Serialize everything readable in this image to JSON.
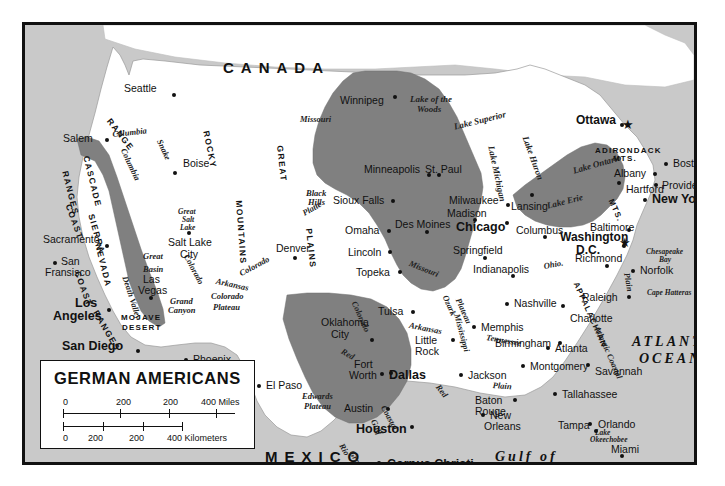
{
  "map": {
    "title": "GERMAN AMERICANS",
    "countries": [
      {
        "name": "CANADA",
        "x": 198,
        "y": 35
      },
      {
        "name": "MEXICO",
        "x": 240,
        "y": 424
      }
    ],
    "oceans": [
      {
        "name": "ATLANTIC",
        "x": 607,
        "y": 310
      },
      {
        "name": "OCEAN",
        "x": 614,
        "y": 327
      },
      {
        "name": "Gulf of",
        "x": 470,
        "y": 425
      },
      {
        "name": "Mexico",
        "x": 470,
        "y": 440
      }
    ],
    "cities": [
      {
        "name": "Seattle",
        "x": 99,
        "y": 58,
        "dx": 48,
        "dy": 10,
        "style": "city"
      },
      {
        "name": "Salem",
        "x": 38,
        "y": 108,
        "dx": 42,
        "dy": 5,
        "style": "city"
      },
      {
        "name": "Boise",
        "x": 158,
        "y": 133,
        "dx": -10,
        "dy": 13,
        "style": "city"
      },
      {
        "name": "Sacramento",
        "x": 18,
        "y": 209,
        "dx": 62,
        "dy": 10,
        "style": "city"
      },
      {
        "name": "San",
        "x": 36,
        "y": 231,
        "dx": -8,
        "dy": 5,
        "style": "city"
      },
      {
        "name": "Fransisco",
        "x": 20,
        "y": 242,
        "dx": 0,
        "dy": 0,
        "style": "city"
      },
      {
        "name": "Los",
        "x": 50,
        "y": 272,
        "dx": 32,
        "dy": 11,
        "style": "city-big"
      },
      {
        "name": "Angeles",
        "x": 28,
        "y": 285,
        "dx": 0,
        "dy": 0,
        "style": "city-big"
      },
      {
        "name": "San Diego",
        "x": 37,
        "y": 315,
        "dx": 74,
        "dy": 9,
        "style": "city-big"
      },
      {
        "name": "Las",
        "x": 118,
        "y": 249,
        "dx": 6,
        "dy": 22,
        "style": "city"
      },
      {
        "name": "Vegas",
        "x": 113,
        "y": 260,
        "dx": 0,
        "dy": 0,
        "style": "city"
      },
      {
        "name": "Salt Lake",
        "x": 143,
        "y": 212,
        "dx": 19,
        "dy": -6,
        "style": "city"
      },
      {
        "name": "City",
        "x": 155,
        "y": 224,
        "dx": 0,
        "dy": 0,
        "style": "city"
      },
      {
        "name": "Phoenix",
        "x": 168,
        "y": 329,
        "dx": -9,
        "dy": 4,
        "style": "city"
      },
      {
        "name": "Tuscon",
        "x": 181,
        "y": 346,
        "dx": -6,
        "dy": 5,
        "style": "city"
      },
      {
        "name": "Denver",
        "x": 251,
        "y": 218,
        "dx": 17,
        "dy": 13,
        "style": "city"
      },
      {
        "name": "El Paso",
        "x": 241,
        "y": 355,
        "dx": -9,
        "dy": 4,
        "style": "city"
      },
      {
        "name": "Winnipeg",
        "x": 315,
        "y": 70,
        "dx": 53,
        "dy": 0,
        "style": "city"
      },
      {
        "name": "Minneapolis",
        "x": 339,
        "y": 139,
        "dx": 63,
        "dy": 9,
        "style": "city"
      },
      {
        "name": "St. Paul",
        "x": 400,
        "y": 139,
        "dx": 12,
        "dy": 9,
        "style": "city"
      },
      {
        "name": "Sioux Falls",
        "x": 308,
        "y": 170,
        "dx": 58,
        "dy": 4,
        "style": "city"
      },
      {
        "name": "Milwaukee",
        "x": 424,
        "y": 170,
        "dx": 57,
        "dy": 8,
        "style": "city"
      },
      {
        "name": "Madison",
        "x": 422,
        "y": 183,
        "dx": 26,
        "dy": 10,
        "style": "city"
      },
      {
        "name": "Omaha",
        "x": 320,
        "y": 200,
        "dx": 42,
        "dy": 4,
        "style": "city"
      },
      {
        "name": "Des Moines",
        "x": 370,
        "y": 194,
        "dx": 30,
        "dy": 11,
        "style": "city"
      },
      {
        "name": "Chicago",
        "x": 431,
        "y": 196,
        "dx": 49,
        "dy": 0,
        "style": "city-big"
      },
      {
        "name": "Lincoln",
        "x": 323,
        "y": 222,
        "dx": 40,
        "dy": 3,
        "style": "city"
      },
      {
        "name": "Topeka",
        "x": 331,
        "y": 242,
        "dx": 42,
        "dy": 3,
        "style": "city"
      },
      {
        "name": "Springfield",
        "x": 428,
        "y": 220,
        "dx": 30,
        "dy": 11,
        "style": "city"
      },
      {
        "name": "Indianapolis",
        "x": 448,
        "y": 239,
        "dx": 38,
        "dy": 10,
        "style": "city"
      },
      {
        "name": "Lansing",
        "x": 486,
        "y": 176,
        "dx": 19,
        "dy": -8,
        "style": "city"
      },
      {
        "name": "Columbus",
        "x": 491,
        "y": 200,
        "dx": 27,
        "dy": 10,
        "style": "city"
      },
      {
        "name": "Baltimore",
        "x": 565,
        "y": 197,
        "dx": 37,
        "dy": 6,
        "style": "city"
      },
      {
        "name": "Washington",
        "x": 535,
        "y": 206,
        "dx": 62,
        "dy": 13,
        "style": "capital"
      },
      {
        "name": "D.C.",
        "x": 551,
        "y": 219,
        "dx": 0,
        "dy": 0,
        "style": "capital"
      },
      {
        "name": "Ottawa",
        "x": 551,
        "y": 89,
        "dx": 44,
        "dy": 9,
        "style": "capital"
      },
      {
        "name": "Albany",
        "x": 589,
        "y": 143,
        "dx": 39,
        "dy": 4,
        "style": "city"
      },
      {
        "name": "Hartford",
        "x": 601,
        "y": 159,
        "dx": -9,
        "dy": -3,
        "style": "city"
      },
      {
        "name": "Boston",
        "x": 648,
        "y": 133,
        "dx": -9,
        "dy": 4,
        "style": "city"
      },
      {
        "name": "Providence",
        "x": 637,
        "y": 155,
        "dx": -8,
        "dy": 3,
        "style": "city"
      },
      {
        "name": "New York",
        "x": 627,
        "y": 168,
        "dx": -9,
        "dy": 5,
        "style": "city-big"
      },
      {
        "name": "Richmond",
        "x": 550,
        "y": 228,
        "dx": 30,
        "dy": 11,
        "style": "city"
      },
      {
        "name": "Norfolk",
        "x": 615,
        "y": 240,
        "dx": -9,
        "dy": 4,
        "style": "city"
      },
      {
        "name": "Raleigh",
        "x": 557,
        "y": 267,
        "dx": 45,
        "dy": 3,
        "style": "city"
      },
      {
        "name": "Charlotte",
        "x": 545,
        "y": 288,
        "dx": -9,
        "dy": -9,
        "style": "city"
      },
      {
        "name": "Nashville",
        "x": 489,
        "y": 273,
        "dx": -9,
        "dy": 4,
        "style": "city"
      },
      {
        "name": "Memphis",
        "x": 456,
        "y": 297,
        "dx": -9,
        "dy": 3,
        "style": "city"
      },
      {
        "name": "Birmingham",
        "x": 470,
        "y": 313,
        "dx": 63,
        "dy": 3,
        "style": "city"
      },
      {
        "name": "Atlanta",
        "x": 530,
        "y": 318,
        "dx": -9,
        "dy": 3,
        "style": "city"
      },
      {
        "name": "Montgomery",
        "x": 505,
        "y": 336,
        "dx": -9,
        "dy": 3,
        "style": "city"
      },
      {
        "name": "Savannah",
        "x": 570,
        "y": 341,
        "dx": -9,
        "dy": -3,
        "style": "city"
      },
      {
        "name": "Tallahassee",
        "x": 537,
        "y": 364,
        "dx": -9,
        "dy": 3,
        "style": "city"
      },
      {
        "name": "Jackson",
        "x": 443,
        "y": 345,
        "dx": -9,
        "dy": 3,
        "style": "city"
      },
      {
        "name": "Baton",
        "x": 450,
        "y": 370,
        "dx": 38,
        "dy": 3,
        "style": "city"
      },
      {
        "name": "Rouge",
        "x": 450,
        "y": 381,
        "dx": 0,
        "dy": 0,
        "style": "city"
      },
      {
        "name": "New",
        "x": 465,
        "y": 385,
        "dx": -9,
        "dy": 3,
        "style": "city"
      },
      {
        "name": "Orleans",
        "x": 459,
        "y": 396,
        "dx": 0,
        "dy": 0,
        "style": "city"
      },
      {
        "name": "Tampa",
        "x": 533,
        "y": 395,
        "dx": 36,
        "dy": 9,
        "style": "city"
      },
      {
        "name": "Orlando",
        "x": 573,
        "y": 394,
        "dx": -10,
        "dy": 3,
        "style": "city"
      },
      {
        "name": "Miami",
        "x": 586,
        "y": 419,
        "dx": 9,
        "dy": 10,
        "style": "city"
      },
      {
        "name": "Tulsa",
        "x": 353,
        "y": 281,
        "dx": 33,
        "dy": 4,
        "style": "city"
      },
      {
        "name": "Oklahoma",
        "x": 296,
        "y": 292,
        "dx": 49,
        "dy": 21,
        "style": "city"
      },
      {
        "name": "City",
        "x": 306,
        "y": 304,
        "dx": 0,
        "dy": 0,
        "style": "city"
      },
      {
        "name": "Little",
        "x": 390,
        "y": 310,
        "dx": 36,
        "dy": 3,
        "style": "city"
      },
      {
        "name": "Rock",
        "x": 390,
        "y": 321,
        "dx": 0,
        "dy": 0,
        "style": "city"
      },
      {
        "name": "Fort",
        "x": 329,
        "y": 334,
        "dx": 35,
        "dy": 12,
        "style": "city"
      },
      {
        "name": "Worth",
        "x": 324,
        "y": 345,
        "dx": 0,
        "dy": 0,
        "style": "city"
      },
      {
        "name": "Dallas",
        "x": 364,
        "y": 344,
        "dx": -9,
        "dy": 3,
        "style": "city-big"
      },
      {
        "name": "Austin",
        "x": 319,
        "y": 378,
        "dx": 42,
        "dy": 4,
        "style": "city"
      },
      {
        "name": "Houston",
        "x": 331,
        "y": 398,
        "dx": 54,
        "dy": 2,
        "style": "city-big"
      },
      {
        "name": "Corpus Christi",
        "x": 362,
        "y": 433,
        "dx": -10,
        "dy": 3,
        "style": "city-big"
      }
    ],
    "water_labels": [
      {
        "name": "Lake of the",
        "x": 385,
        "y": 70,
        "style": "water"
      },
      {
        "name": "Woods",
        "x": 392,
        "y": 80,
        "style": "water"
      },
      {
        "name": "Lake Superior",
        "x": 428,
        "y": 98,
        "style": "water",
        "rot": -14
      },
      {
        "name": "Lake Michigan",
        "x": 470,
        "y": 120,
        "style": "water",
        "rot": 78
      },
      {
        "name": "Lake Huron",
        "x": 504,
        "y": 110,
        "style": "water",
        "rot": 70
      },
      {
        "name": "Lake Ontario",
        "x": 547,
        "y": 142,
        "style": "water",
        "rot": -16
      },
      {
        "name": "Lake Erie",
        "x": 521,
        "y": 177,
        "style": "water",
        "rot": -14
      },
      {
        "name": "Great",
        "x": 153,
        "y": 183,
        "style": "water-sm"
      },
      {
        "name": "Salt",
        "x": 157,
        "y": 191,
        "style": "water-sm"
      },
      {
        "name": "Lake",
        "x": 155,
        "y": 199,
        "style": "water-sm"
      },
      {
        "name": "Chesapeake",
        "x": 621,
        "y": 223,
        "style": "water-sm"
      },
      {
        "name": "Bay",
        "x": 634,
        "y": 231,
        "style": "water-sm"
      },
      {
        "name": "Cape Hatteras",
        "x": 622,
        "y": 264,
        "style": "water-sm"
      },
      {
        "name": "Lake",
        "x": 570,
        "y": 404,
        "style": "water-sm"
      },
      {
        "name": "Okeechobee",
        "x": 565,
        "y": 411,
        "style": "water-sm"
      },
      {
        "name": "Missouri",
        "x": 275,
        "y": 90,
        "style": "physio",
        "rot": 0
      },
      {
        "name": "Columbia",
        "x": 87,
        "y": 105,
        "style": "physio",
        "rot": -6
      },
      {
        "name": "Columbia",
        "x": 102,
        "y": 122,
        "style": "physio",
        "rot": 65
      },
      {
        "name": "Snake",
        "x": 138,
        "y": 113,
        "style": "physio",
        "rot": 65
      },
      {
        "name": "Platte",
        "x": 276,
        "y": 185,
        "style": "physio",
        "rot": -30
      },
      {
        "name": "Colorado",
        "x": 165,
        "y": 228,
        "style": "physio",
        "rot": 62
      },
      {
        "name": "Colorado",
        "x": 213,
        "y": 245,
        "style": "physio",
        "rot": -28
      },
      {
        "name": "Arkansas",
        "x": 192,
        "y": 252,
        "style": "physio",
        "rot": 12
      },
      {
        "name": "Missouri",
        "x": 386,
        "y": 234,
        "style": "physio",
        "rot": 22
      },
      {
        "name": "Arkansas",
        "x": 385,
        "y": 296,
        "style": "physio",
        "rot": 11
      },
      {
        "name": "Mississippi",
        "x": 436,
        "y": 288,
        "style": "physio",
        "rot": 75
      },
      {
        "name": "Ohio.",
        "x": 518,
        "y": 237,
        "style": "physio",
        "rot": -10
      },
      {
        "name": "Tennessee",
        "x": 462,
        "y": 308,
        "style": "physio",
        "rot": 10
      },
      {
        "name": "Red",
        "x": 319,
        "y": 322,
        "style": "physio",
        "rot": 30
      },
      {
        "name": "Red",
        "x": 416,
        "y": 358,
        "style": "physio",
        "rot": 52
      },
      {
        "name": "Rio",
        "x": 320,
        "y": 417,
        "style": "physio",
        "rot": 60
      },
      {
        "name": "Grande",
        "x": 330,
        "y": 424,
        "style": "physio",
        "rot": 60
      },
      {
        "name": "Colorado",
        "x": 333,
        "y": 275,
        "style": "physio",
        "rot": 66
      }
    ],
    "physio_labels": [
      {
        "name": "Black",
        "x": 281,
        "y": 164,
        "style": "physio"
      },
      {
        "name": "Hills",
        "x": 283,
        "y": 173,
        "style": "physio"
      },
      {
        "name": "Great",
        "x": 118,
        "y": 227,
        "style": "physio"
      },
      {
        "name": "Basin",
        "x": 118,
        "y": 240,
        "style": "physio"
      },
      {
        "name": "Death Valley",
        "x": 104,
        "y": 250,
        "style": "physio",
        "rot": 72
      },
      {
        "name": "Grand",
        "x": 145,
        "y": 272,
        "style": "physio"
      },
      {
        "name": "Canyon",
        "x": 143,
        "y": 281,
        "style": "physio"
      },
      {
        "name": "Colorado",
        "x": 186,
        "y": 267,
        "style": "physio"
      },
      {
        "name": "Plateau",
        "x": 188,
        "y": 278,
        "style": "physio"
      },
      {
        "name": "Ozark",
        "x": 424,
        "y": 269,
        "style": "physio",
        "rot": 66
      },
      {
        "name": "Plateau",
        "x": 437,
        "y": 272,
        "style": "physio",
        "rot": 66
      },
      {
        "name": "Edwards",
        "x": 277,
        "y": 367,
        "style": "physio"
      },
      {
        "name": "Plateau",
        "x": 279,
        "y": 377,
        "style": "physio"
      },
      {
        "name": "Gulf",
        "x": 352,
        "y": 393,
        "style": "physio",
        "rot": 64
      },
      {
        "name": "Coastal",
        "x": 362,
        "y": 379,
        "style": "physio",
        "rot": 62
      },
      {
        "name": "Plain",
        "x": 468,
        "y": 356,
        "style": "physio",
        "rot": 4
      },
      {
        "name": "Atlantic Coastal",
        "x": 576,
        "y": 300,
        "style": "physio",
        "rot": 66
      },
      {
        "name": "Plain",
        "x": 606,
        "y": 247,
        "style": "physio",
        "rot": 80
      },
      {
        "name": "MOJAVE",
        "x": 96,
        "y": 289,
        "style": "physio-caps"
      },
      {
        "name": "DESERT",
        "x": 97,
        "y": 299,
        "style": "physio-caps"
      },
      {
        "name": "ADIRONDACK",
        "x": 570,
        "y": 122,
        "style": "physio-caps"
      },
      {
        "name": "MTS.",
        "x": 588,
        "y": 130,
        "style": "physio-caps"
      },
      {
        "name": "APPALACHIAN",
        "x": 554,
        "y": 256,
        "style": "physio-caps",
        "rot": 66
      },
      {
        "name": "MTS.",
        "x": 589,
        "y": 173,
        "style": "physio-caps",
        "rot": 66
      }
    ],
    "range_labels": [
      {
        "name": "COAST",
        "x": 47,
        "y": 178,
        "rot": 70
      },
      {
        "name": "RANGES",
        "x": 44,
        "y": 145,
        "rot": 76
      },
      {
        "name": "CASCADE",
        "x": 65,
        "y": 130,
        "rot": 76
      },
      {
        "name": "RANGE",
        "x": 87,
        "y": 92,
        "rot": 52
      },
      {
        "name": "SIERRA",
        "x": 70,
        "y": 188,
        "rot": 74
      },
      {
        "name": "NEVADA",
        "x": 77,
        "y": 218,
        "rot": 76
      },
      {
        "name": "COAST",
        "x": 56,
        "y": 245,
        "rot": 70
      },
      {
        "name": "RANGES",
        "x": 74,
        "y": 284,
        "rot": 60
      },
      {
        "name": "ROCKY",
        "x": 185,
        "y": 105,
        "rot": 78
      },
      {
        "name": "MOUNTAINS",
        "x": 218,
        "y": 175,
        "rot": 86
      },
      {
        "name": "GREAT",
        "x": 259,
        "y": 120,
        "rot": 84
      },
      {
        "name": "PLAINS",
        "x": 288,
        "y": 203,
        "rot": 84
      }
    ],
    "legend": {
      "miles": {
        "labels": [
          "0",
          "200",
          "200",
          "400 Miles"
        ],
        "positions": [
          0,
          36,
          60,
          86
        ]
      },
      "kilometers": {
        "labels": [
          "0",
          "200",
          "200",
          "400 Kilometers"
        ],
        "positions": [
          0,
          17,
          36,
          57
        ]
      }
    },
    "colors": {
      "highlight": "#808080",
      "land": "#ffffff",
      "ocean": "#c9c9c9",
      "border": "#111111",
      "state_line": "#9a9a9a"
    }
  }
}
